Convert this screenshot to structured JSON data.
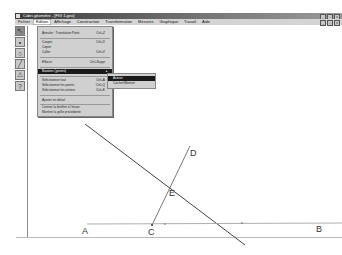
{
  "window": {
    "title": "Cabri-géomètre - [FIG 1.geo]",
    "controls": [
      "_",
      "□",
      "x"
    ]
  },
  "menubar": {
    "items": [
      "Fichier",
      "Edition",
      "Affichage",
      "Construction",
      "Transformation",
      "Mesures",
      "Graphique",
      "Travail",
      "Aide"
    ],
    "active_index": 1,
    "doc_controls": [
      "_",
      "□",
      "x"
    ]
  },
  "toolbar": {
    "tools": [
      {
        "name": "pointer-tool",
        "glyph": "↖"
      },
      {
        "name": "point-tool",
        "glyph": "•"
      },
      {
        "name": "circle-tool",
        "glyph": "○"
      },
      {
        "name": "line-tool",
        "glyph": "╱"
      },
      {
        "name": "construction-tool",
        "glyph": "⚠"
      },
      {
        "name": "help-tool",
        "glyph": "?"
      }
    ]
  },
  "edit_menu": {
    "items": [
      {
        "label": "Annuler : Translation Point",
        "shortcut": "Ctrl+Z"
      },
      {
        "label": "Couper",
        "shortcut": "Ctrl+X"
      },
      {
        "label": "Copier",
        "shortcut": ""
      },
      {
        "label": "Coller",
        "shortcut": "Ctrl+V"
      },
      {
        "label": "Effacer",
        "shortcut": "Ctrl+Suppr"
      },
      {
        "label": "Boutons (gestes)",
        "shortcut": "▸",
        "highlighted": true
      },
      {
        "label": "Sélectionner tout",
        "shortcut": "Ctrl+A"
      },
      {
        "label": "Sélectionner les points",
        "shortcut": "Ctrl+Q"
      },
      {
        "label": "Sélectionner les entiers",
        "shortcut": "Ctrl+E"
      },
      {
        "label": "Ajuster en détail",
        "shortcut": ""
      },
      {
        "label": "Centrer la fenêtre à l'écran",
        "shortcut": ""
      },
      {
        "label": "Montrer la grille précédente",
        "shortcut": ""
      }
    ]
  },
  "submenu": {
    "items": [
      {
        "label": "Activer",
        "highlighted": true
      },
      {
        "label": "Cacher/Montrer",
        "highlighted": false
      }
    ]
  },
  "figure": {
    "points": [
      {
        "label": "A",
        "x": 82,
        "y": 232
      },
      {
        "label": "B",
        "x": 316,
        "y": 230
      },
      {
        "label": "C",
        "x": 148,
        "y": 233
      },
      {
        "label": "D",
        "x": 190,
        "y": 154
      },
      {
        "label": "E",
        "x": 171,
        "y": 194
      }
    ],
    "line_color": "#444444"
  }
}
